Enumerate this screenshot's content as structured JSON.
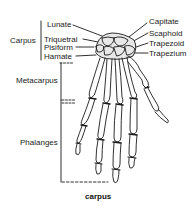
{
  "diagram": {
    "caption": "carpus",
    "groups": {
      "carpus": "Carpus",
      "metacarpus": "Metacarpus",
      "phalanges": "Phalanges"
    },
    "left_labels": [
      "Lunate",
      "Triquetral",
      "Pisiform",
      "Hamate"
    ],
    "right_labels": [
      "Capitate",
      "Scaphoid",
      "Trapezoid",
      "Trapezium"
    ],
    "colors": {
      "line": "#1a1a1a",
      "background": "#ffffff"
    }
  }
}
